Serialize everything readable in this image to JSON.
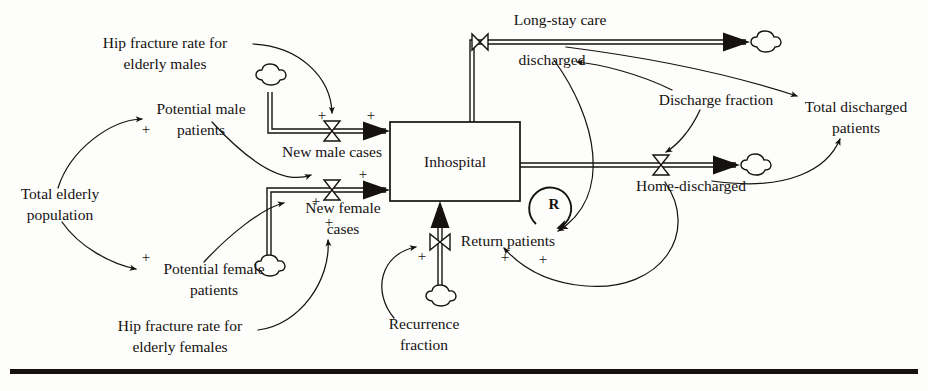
{
  "diagram": {
    "type": "system-dynamics-stock-and-flow",
    "stocks": [
      {
        "id": "inhospital",
        "label": "Inhospital"
      }
    ],
    "flows": [
      {
        "id": "new-male-cases",
        "label": "New male cases"
      },
      {
        "id": "new-female-cases",
        "label": "New female cases"
      },
      {
        "id": "return-patients",
        "label": "Return patients"
      },
      {
        "id": "long-stay-care-discharged",
        "label": "Long-stay care discharged",
        "line1": "Long-stay care",
        "line2": "discharged"
      },
      {
        "id": "home-discharged",
        "label": "Home-discharged"
      }
    ],
    "variables": [
      {
        "id": "hip-fracture-rate-males",
        "label": "Hip fracture rate for elderly males",
        "line1": "Hip fracture rate for",
        "line2": "elderly males"
      },
      {
        "id": "potential-male-patients",
        "label": "Potential male patients",
        "line1": "Potential male",
        "line2": "patients"
      },
      {
        "id": "total-elderly-population",
        "label": "Total elderly population",
        "line1": "Total elderly",
        "line2": "population"
      },
      {
        "id": "potential-female-patients",
        "label": "Potential female patients",
        "line1": "Potential female",
        "line2": "patients"
      },
      {
        "id": "hip-fracture-rate-females",
        "label": "Hip fracture rate for elderly females",
        "line1": "Hip fracture rate for",
        "line2": "elderly females"
      },
      {
        "id": "recurrence-fraction",
        "label": "Recurrence fraction",
        "line1": "Recurrence",
        "line2": "fraction"
      },
      {
        "id": "discharge-fraction",
        "label": "Discharge fraction",
        "line1": "Discharge fraction",
        "line2": ""
      },
      {
        "id": "total-discharged-patients",
        "label": "Total discharged patients",
        "line1": "Total discharged",
        "line2": "patients"
      }
    ],
    "loops": [
      {
        "id": "reinforcing-loop",
        "label": "R",
        "polarity": "reinforcing"
      }
    ],
    "link_polarities": {
      "positive": "+"
    },
    "colors": {
      "ink": "#15120f",
      "paper": "#fdfdfc"
    }
  }
}
